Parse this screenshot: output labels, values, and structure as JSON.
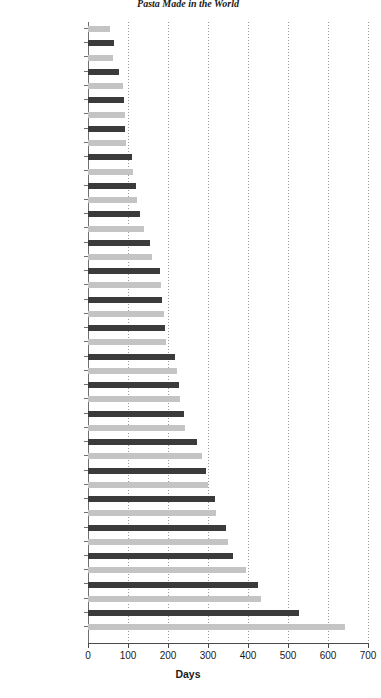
{
  "chart_data": {
    "type": "bar",
    "orientation": "horizontal",
    "title": "Pasta Made in the World",
    "xlabel": "Days",
    "ylabel": "",
    "xlim": [
      0,
      700
    ],
    "xticks": [
      0,
      100,
      200,
      300,
      400,
      500,
      600,
      700
    ],
    "xtick_labels": [
      "0",
      "100",
      "200",
      "300",
      "400",
      "500",
      "600",
      "700"
    ],
    "grid": true,
    "grid_axis": "x",
    "legend": false,
    "colors": {
      "bar_light": "#c4c4c4",
      "bar_dark": "#3b3b3b",
      "axis": "#4a4a4a",
      "gridline": "#9a9a9a",
      "text": "#1a1a1a",
      "background": "#ffffff"
    },
    "categories": [
      "Netherlands",
      "Singapore",
      "Japan",
      "Korea",
      "Denmark",
      "South Africa",
      "Norway",
      "Malaysia",
      "United Kingdom",
      "Turkey",
      "India",
      "Vietnam",
      "Belgium",
      "Ireland",
      "Spain",
      "Germany",
      "Russia",
      "China",
      "Brazil",
      "France",
      "Sweden",
      "Trinidad",
      "Chile",
      "Thailand",
      "Switzerland",
      "Indonesia",
      "Honduras",
      "Finland",
      "Nigeria",
      "Bangladesh",
      "Mexico",
      "Argentina",
      "Israel",
      "Australia",
      "Ecuador",
      "Kuwait",
      "Venezuela",
      "Costa Rica",
      "Canada",
      "Austria",
      "Peru",
      "Colombia",
      "Italy"
    ],
    "values": [
      55,
      65,
      62,
      78,
      88,
      90,
      92,
      92,
      95,
      110,
      112,
      120,
      122,
      130,
      140,
      155,
      160,
      180,
      182,
      185,
      190,
      192,
      195,
      218,
      222,
      228,
      230,
      240,
      242,
      272,
      285,
      295,
      300,
      318,
      320,
      345,
      350,
      362,
      395,
      425,
      432,
      528,
      642
    ],
    "bar_shades": [
      "light",
      "dark",
      "light",
      "dark",
      "light",
      "dark",
      "light",
      "dark",
      "light",
      "dark",
      "light",
      "dark",
      "light",
      "dark",
      "light",
      "dark",
      "light",
      "dark",
      "light",
      "dark",
      "light",
      "dark",
      "light",
      "dark",
      "light",
      "dark",
      "light",
      "dark",
      "light",
      "dark",
      "light",
      "dark",
      "light",
      "dark",
      "light",
      "dark",
      "light",
      "dark",
      "light",
      "dark",
      "light",
      "dark",
      "light"
    ]
  }
}
